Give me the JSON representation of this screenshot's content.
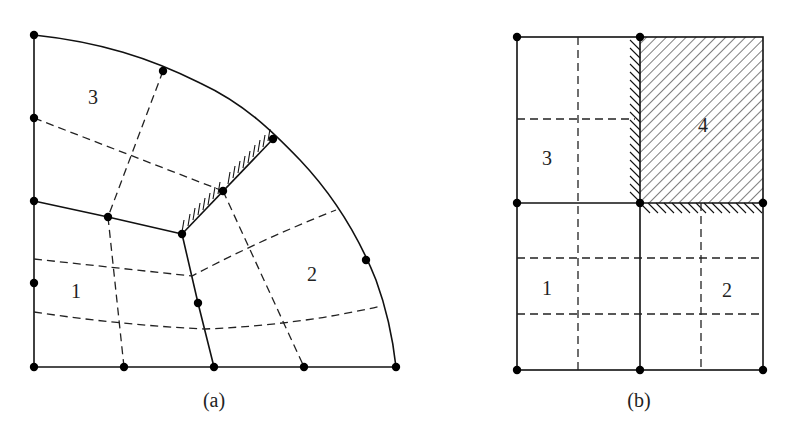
{
  "figure_a": {
    "caption": "(a)",
    "region_labels": [
      {
        "text": "3",
        "x": 93,
        "y": 104
      },
      {
        "text": "1",
        "x": 76,
        "y": 298
      },
      {
        "text": "2",
        "x": 312,
        "y": 281
      }
    ],
    "nodes": [
      [
        34,
        35
      ],
      [
        163,
        71
      ],
      [
        273,
        139
      ],
      [
        366,
        260
      ],
      [
        396,
        367
      ],
      [
        34,
        118
      ],
      [
        34,
        201
      ],
      [
        34,
        283
      ],
      [
        34,
        367
      ],
      [
        108,
        217
      ],
      [
        182,
        234
      ],
      [
        223,
        191
      ],
      [
        198,
        303
      ],
      [
        124,
        367
      ],
      [
        214,
        367
      ],
      [
        304,
        367
      ]
    ],
    "hatched_edge": {
      "from": [
        182,
        234
      ],
      "to": [
        273,
        139
      ]
    }
  },
  "figure_b": {
    "caption": "(b)",
    "region_labels": [
      {
        "text": "3",
        "x": 547,
        "y": 165
      },
      {
        "text": "4",
        "x": 703,
        "y": 132
      },
      {
        "text": "1",
        "x": 547,
        "y": 295
      },
      {
        "text": "2",
        "x": 727,
        "y": 297
      }
    ],
    "nodes": [
      [
        517,
        37
      ],
      [
        640,
        37
      ],
      [
        517,
        203
      ],
      [
        640,
        203
      ],
      [
        763,
        203
      ],
      [
        517,
        370
      ],
      [
        640,
        370
      ],
      [
        763,
        370
      ]
    ],
    "shaded_region": "4"
  }
}
